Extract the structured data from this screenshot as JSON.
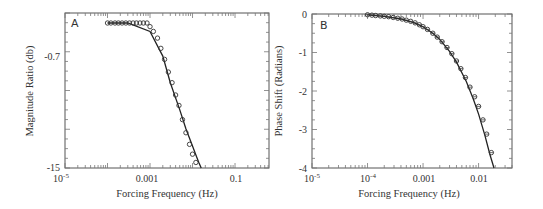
{
  "chart_data": [
    {
      "type": "line",
      "panel_label": "A",
      "title": "",
      "xlabel": "Forcing Frequency (Hz)",
      "ylabel": "Magnitude Ratio (db)",
      "xscale": "log",
      "xlim": [
        1e-05,
        0.63
      ],
      "ylim": [
        -15,
        0.5
      ],
      "x_ticks": [
        {
          "value": 1e-05,
          "label": "10^-5"
        },
        {
          "value": 0.001,
          "label": "0.001"
        },
        {
          "value": 0.1,
          "label": "0.1"
        }
      ],
      "y_ticks": [
        {
          "value": -0.7,
          "label": "-0.7"
        },
        {
          "value": -15,
          "label": "-15"
        }
      ],
      "grid": false,
      "series": [
        {
          "name": "model",
          "style": "line",
          "x": [
            0.0001,
            0.0003,
            0.001,
            0.002,
            0.003,
            0.005,
            0.007,
            0.01,
            0.012,
            0.014,
            0.016
          ],
          "y": [
            0,
            0,
            -0.05,
            -0.3,
            -0.9,
            -2.3,
            -4.3,
            -7.5,
            -10,
            -12.5,
            -15
          ]
        },
        {
          "name": "observed",
          "style": "markers",
          "marker": "open-circle",
          "x": [
            0.0001,
            0.00012,
            0.00015,
            0.00018,
            0.00022,
            0.00027,
            0.00033,
            0.0004,
            0.00048,
            0.00058,
            0.0007,
            0.00085,
            0.001,
            0.0012,
            0.0015,
            0.0018,
            0.0022,
            0.0027,
            0.0033,
            0.004,
            0.0048,
            0.0058,
            0.007,
            0.0085,
            0.01,
            0.012
          ],
          "y": [
            0,
            0,
            0,
            0,
            0,
            0,
            0,
            0,
            0,
            0,
            0,
            0,
            -0.02,
            -0.05,
            -0.1,
            -0.2,
            -0.35,
            -0.6,
            -0.9,
            -1.4,
            -2.0,
            -3.2,
            -4.9,
            -7.1,
            -9.7,
            -12.6
          ]
        }
      ]
    },
    {
      "type": "line",
      "panel_label": "B",
      "title": "",
      "xlabel": "Forcing Frequency (Hz)",
      "ylabel": "Phase Shift (Radians)",
      "xscale": "log",
      "xlim": [
        1e-05,
        0.04
      ],
      "ylim": [
        -4,
        0
      ],
      "x_ticks": [
        {
          "value": 1e-05,
          "label": "10^-5"
        },
        {
          "value": 0.0001,
          "label": "10^-4"
        },
        {
          "value": 0.001,
          "label": "0.001"
        },
        {
          "value": 0.01,
          "label": "0.01"
        }
      ],
      "y_ticks": [
        {
          "value": 0,
          "label": "0"
        },
        {
          "value": -1,
          "label": "-1"
        },
        {
          "value": -2,
          "label": "-2"
        },
        {
          "value": -3,
          "label": "-3"
        },
        {
          "value": -4,
          "label": "-4"
        }
      ],
      "grid": false,
      "series": [
        {
          "name": "model",
          "style": "line",
          "x": [
            0.0001,
            0.0002,
            0.0004,
            0.0007,
            0.001,
            0.0015,
            0.002,
            0.003,
            0.004,
            0.006,
            0.008,
            0.01,
            0.013,
            0.016,
            0.019
          ],
          "y": [
            -0.02,
            -0.06,
            -0.13,
            -0.23,
            -0.33,
            -0.5,
            -0.66,
            -0.97,
            -1.25,
            -1.75,
            -2.2,
            -2.6,
            -3.15,
            -3.65,
            -4.0
          ]
        },
        {
          "name": "observed",
          "style": "markers",
          "marker": "open-circle-cross",
          "x": [
            0.0001,
            0.00012,
            0.00014,
            0.00017,
            0.0002,
            0.00024,
            0.00029,
            0.00035,
            0.00042,
            0.0005,
            0.0006,
            0.00072,
            0.00086,
            0.001,
            0.0012,
            0.0015,
            0.0018,
            0.0022,
            0.0027,
            0.0033,
            0.004,
            0.0048,
            0.0058,
            0.007,
            0.0085,
            0.01,
            0.012,
            0.014,
            0.017
          ],
          "y": [
            -0.02,
            -0.03,
            -0.04,
            -0.05,
            -0.06,
            -0.07,
            -0.09,
            -0.11,
            -0.13,
            -0.16,
            -0.19,
            -0.23,
            -0.28,
            -0.33,
            -0.4,
            -0.5,
            -0.6,
            -0.72,
            -0.87,
            -1.03,
            -1.22,
            -1.42,
            -1.65,
            -1.9,
            -2.15,
            -2.4,
            -2.75,
            -3.12,
            -3.6
          ]
        }
      ]
    }
  ],
  "panels": {
    "a": {
      "label": "A",
      "xlabel": "Forcing Frequency (Hz)",
      "ylabel": "Magnitude Ratio (db)",
      "xticks": {
        "t0_base": "10",
        "t0_exp": "-5",
        "t1": "0.001",
        "t2": "0.1"
      },
      "yticks": {
        "t0": "-0.7",
        "t1": "-15"
      }
    },
    "b": {
      "label": "B",
      "xlabel": "Forcing Frequency (Hz)",
      "ylabel": "Phase Shift (Radians)",
      "xticks": {
        "t0_base": "10",
        "t0_exp": "-5",
        "t1_base": "10",
        "t1_exp": "-4",
        "t2": "0.001",
        "t3": "0.01"
      },
      "yticks": {
        "t0": "0",
        "t1": "-1",
        "t2": "-2",
        "t3": "-3",
        "t4": "-4"
      }
    }
  },
  "colors": {
    "ink": "#222222",
    "frame": "#555555",
    "background": "#ffffff"
  }
}
